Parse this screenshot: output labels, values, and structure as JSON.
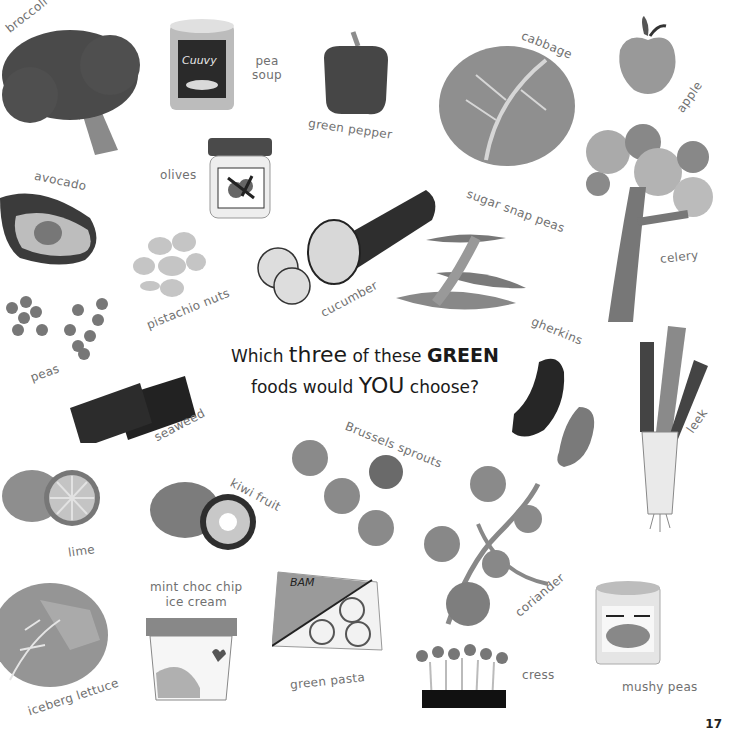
{
  "page": {
    "number": "17",
    "question": {
      "part1": "Which ",
      "three": "three",
      "part2": " of these ",
      "green": "GREEN",
      "part3": "foods would ",
      "you": "YOU",
      "part4": " choose?"
    }
  },
  "foods": [
    {
      "id": "broccoli",
      "label": "broccoli",
      "icon": "broccoli-icon"
    },
    {
      "id": "pea-soup",
      "label": "pea soup",
      "icon": "soup-can-icon",
      "can_label": "Cuuvy"
    },
    {
      "id": "green-pepper",
      "label": "green pepper",
      "icon": "pepper-icon"
    },
    {
      "id": "cabbage",
      "label": "cabbage",
      "icon": "cabbage-icon"
    },
    {
      "id": "apple",
      "label": "apple",
      "icon": "apple-icon"
    },
    {
      "id": "avocado",
      "label": "avocado",
      "icon": "avocado-icon"
    },
    {
      "id": "olives",
      "label": "olives",
      "icon": "olive-jar-icon"
    },
    {
      "id": "celery",
      "label": "celery",
      "icon": "celery-icon"
    },
    {
      "id": "sugar-snap-peas",
      "label": "sugar snap peas",
      "icon": "snap-peas-icon"
    },
    {
      "id": "cucumber",
      "label": "cucumber",
      "icon": "cucumber-icon"
    },
    {
      "id": "pistachio-nuts",
      "label": "pistachio nuts",
      "icon": "pistachio-icon"
    },
    {
      "id": "peas",
      "label": "peas",
      "icon": "peas-icon"
    },
    {
      "id": "gherkins",
      "label": "gherkins",
      "icon": "gherkin-icon"
    },
    {
      "id": "leek",
      "label": "leek",
      "icon": "leek-icon"
    },
    {
      "id": "seaweed",
      "label": "seaweed",
      "icon": "seaweed-icon"
    },
    {
      "id": "brussels-sprouts",
      "label": "Brussels sprouts",
      "icon": "sprouts-icon"
    },
    {
      "id": "kiwi-fruit",
      "label": "kiwi fruit",
      "icon": "kiwi-icon"
    },
    {
      "id": "lime",
      "label": "lime",
      "icon": "lime-icon"
    },
    {
      "id": "coriander",
      "label": "coriander",
      "icon": "coriander-icon"
    },
    {
      "id": "mint-choc-chip",
      "label": "mint choc chip ice cream",
      "label_line1": "mint choc chip",
      "label_line2": "ice cream",
      "icon": "ice-cream-tub-icon"
    },
    {
      "id": "green-pasta",
      "label": "green pasta",
      "icon": "pasta-pack-icon",
      "pack_label": "BAM"
    },
    {
      "id": "iceberg-lettuce",
      "label": "iceberg lettuce",
      "icon": "lettuce-icon"
    },
    {
      "id": "cress",
      "label": "cress",
      "icon": "cress-icon"
    },
    {
      "id": "mushy-peas",
      "label": "mushy peas",
      "icon": "mushy-peas-can-icon"
    }
  ],
  "colors": {
    "dark": "#3a3a3a",
    "mid": "#6b6b6b",
    "light": "#a5a5a5",
    "pale": "#d0d0d0",
    "text": "#707070"
  }
}
